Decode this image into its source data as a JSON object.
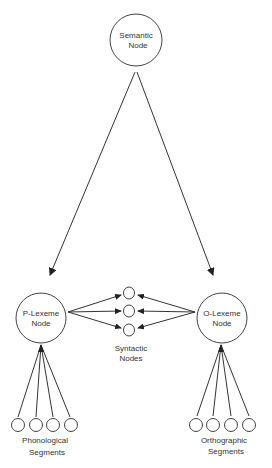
{
  "diagram": {
    "nodes": {
      "semantic": {
        "line1": "Semantic",
        "line2": "Node"
      },
      "p_lexeme": {
        "line1": "P-Lexeme",
        "line2": "Node"
      },
      "o_lexeme": {
        "line1": "O-Lexeme",
        "line2": "Node"
      },
      "syntactic": {
        "line1": "Syntactic",
        "line2": "Nodes",
        "count": 3
      },
      "phonological": {
        "line1": "Phonological",
        "line2": "Segments",
        "count": 4
      },
      "orthographic": {
        "line1": "Orthographic",
        "line2": "Segments",
        "count": 4
      }
    },
    "colors": {
      "stroke": "#333333",
      "text": "#333333",
      "background": "#ffffff"
    }
  }
}
